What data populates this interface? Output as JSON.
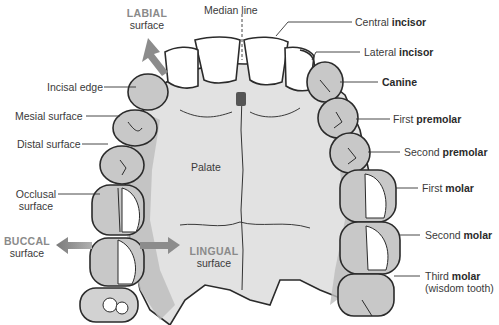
{
  "colors": {
    "outline": "#2b2b2b",
    "palate": "#e4e4e4",
    "gum": "#bdbdbd",
    "tooth_shade": "#c8c8c8",
    "tooth_light": "#ffffff",
    "arrow": "#8c8c8c",
    "direction_label": "#8a8a8a"
  },
  "labels": {
    "median_line": "Median line",
    "labial": {
      "caps": "LABIAL",
      "sub": "surface"
    },
    "buccal": {
      "caps": "BUCCAL",
      "sub": "surface"
    },
    "lingual": {
      "caps": "LINGUAL",
      "sub": "surface"
    },
    "palate": "Palate",
    "left": {
      "incisal_edge": "Incisal edge",
      "mesial_surface": "Mesial surface",
      "distal_surface": "Distal surface",
      "occlusal_1": "Occlusal",
      "occlusal_2": "surface"
    },
    "right": {
      "central_incisor": {
        "plain": "Central ",
        "bold": "incisor"
      },
      "lateral_incisor": {
        "plain": "Lateral ",
        "bold": "incisor"
      },
      "canine": {
        "plain": "",
        "bold": "Canine"
      },
      "first_premolar": {
        "plain": "First ",
        "bold": "premolar"
      },
      "second_premolar": {
        "plain": "Second ",
        "bold": "premolar"
      },
      "first_molar": {
        "plain": "First ",
        "bold": "molar"
      },
      "second_molar": {
        "plain": "Second ",
        "bold": "molar"
      },
      "third_molar": {
        "plain": "Third ",
        "bold": "molar",
        "note": "(wisdom tooth)"
      }
    }
  }
}
